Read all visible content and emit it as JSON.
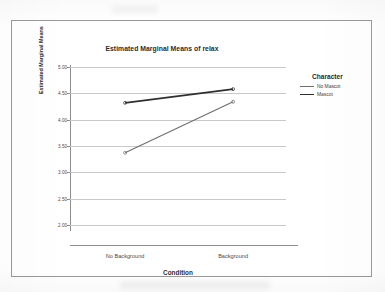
{
  "chart_data": {
    "type": "line",
    "title": "Estimated Marginal Means of relax",
    "xlabel": "Condition",
    "ylabel": "Estimated Marginal Means",
    "categories": [
      "No Background",
      "Background"
    ],
    "ylim": [
      2.0,
      5.0
    ],
    "ytick_labels": [
      "5.00",
      "4.50",
      "4.00",
      "3.50",
      "3.00",
      "2.50",
      "2.00"
    ],
    "ytick_values": [
      5.0,
      4.5,
      4.0,
      3.5,
      3.0,
      2.5,
      2.0
    ],
    "grid": true,
    "legend_title": "Character",
    "legend_position": "right",
    "series": [
      {
        "name": "No Mascot",
        "values": [
          3.37,
          4.34
        ],
        "color": "#6e6e6e",
        "width": 1.1
      },
      {
        "name": "Mascot",
        "values": [
          4.32,
          4.58
        ],
        "color": "#2f2f2f",
        "width": 1.8
      }
    ]
  },
  "figure": {
    "border_color": "#9a9a9a",
    "grid_color": "#c9c9c9",
    "axis_color": "#8d8d8d"
  }
}
